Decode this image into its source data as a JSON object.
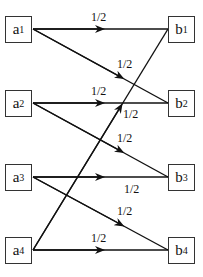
{
  "diagram": {
    "sources": [
      {
        "id": "a1",
        "letter": "a",
        "index": "1"
      },
      {
        "id": "a2",
        "letter": "a",
        "index": "2"
      },
      {
        "id": "a3",
        "letter": "a",
        "index": "3"
      },
      {
        "id": "a4",
        "letter": "a",
        "index": "4"
      }
    ],
    "targets": [
      {
        "id": "b1",
        "letter": "b",
        "index": "1"
      },
      {
        "id": "b2",
        "letter": "b",
        "index": "2"
      },
      {
        "id": "b3",
        "letter": "b",
        "index": "3"
      },
      {
        "id": "b4",
        "letter": "b",
        "index": "4"
      }
    ],
    "edges": [
      {
        "from": "a1",
        "to": "b1",
        "weight": "1/2"
      },
      {
        "from": "a1",
        "to": "b2",
        "weight": "1/2"
      },
      {
        "from": "a2",
        "to": "b2",
        "weight": "1/2"
      },
      {
        "from": "a2",
        "to": "b3",
        "weight": "1/2"
      },
      {
        "from": "a3",
        "to": "b3",
        "weight": "1/2"
      },
      {
        "from": "a3",
        "to": "b4",
        "weight": "1/2"
      },
      {
        "from": "a4",
        "to": "b4",
        "weight": "1/2"
      },
      {
        "from": "a4",
        "to": "b1",
        "weight": "1/2"
      }
    ],
    "colors": {
      "line": "#111111",
      "box_border": "#333333",
      "background": "#ffffff"
    }
  }
}
